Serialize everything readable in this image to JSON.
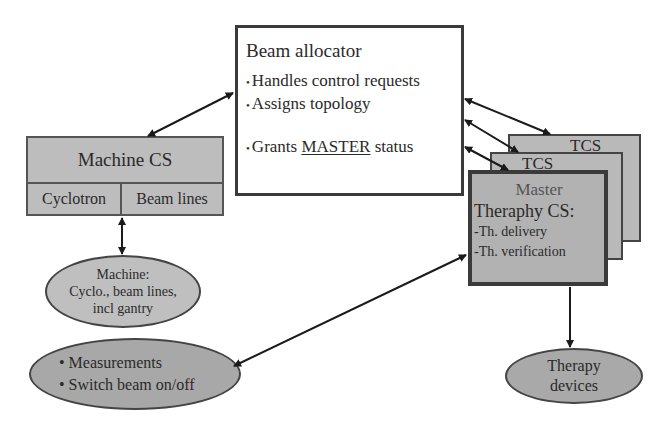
{
  "beam_allocator": {
    "title": "Beam allocator",
    "items": [
      {
        "bullet": "•",
        "text": "Handles control requests"
      },
      {
        "bullet": "•",
        "text": "Assigns topology"
      },
      {
        "bullet": "•",
        "pre": "Grants ",
        "emph": "MASTER",
        "post": " status"
      }
    ]
  },
  "machine_cs": {
    "title": "Machine CS",
    "subsystems": [
      "Cyclotron",
      "Beam lines"
    ]
  },
  "machine_ellipse": {
    "lines": [
      "Machine:",
      "Cyclo., beam lines,",
      "incl gantry"
    ]
  },
  "measurements_ellipse": {
    "items": [
      "• Measurements",
      "• Switch beam on/off"
    ]
  },
  "tcs_stack": {
    "back_label": "TCS",
    "middle_label": "TCS",
    "master": {
      "line1": "Master",
      "line2": "Theraphy CS:",
      "items": [
        "-Th. delivery",
        "-Th. verification"
      ]
    }
  },
  "therapy_devices": {
    "lines": [
      "Therapy",
      "devices"
    ]
  },
  "colors": {
    "box_fill": "#bdbdbd",
    "border": "#3a3a3a",
    "background": "#ffffff"
  }
}
